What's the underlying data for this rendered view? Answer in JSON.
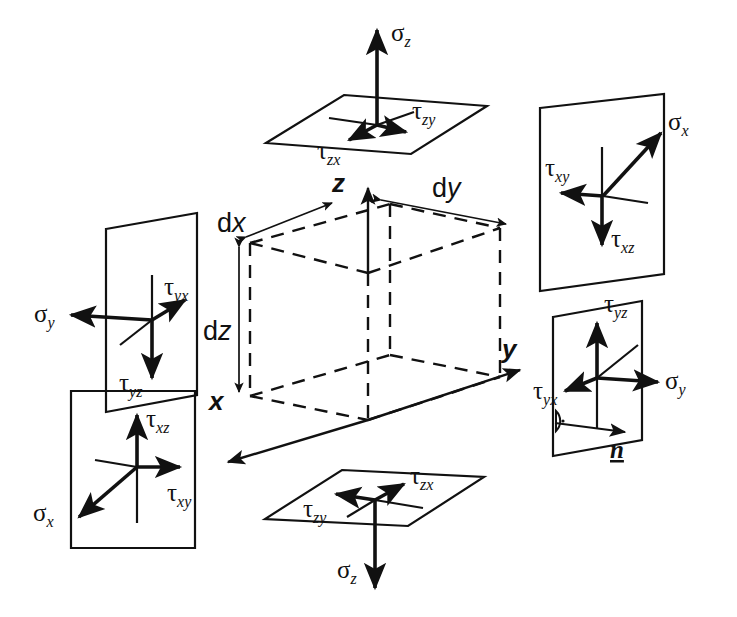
{
  "figure": {
    "background_color": "#ffffff",
    "stroke_color": "#111111",
    "greek_sigma": "σ",
    "greek_tau": "τ"
  },
  "cube": {
    "axes": [
      {
        "name": "z-axis",
        "label": "z",
        "direction": "up"
      },
      {
        "name": "y-axis",
        "label": "y",
        "direction": "right"
      },
      {
        "name": "x-axis",
        "label": "x",
        "direction": "down-left"
      }
    ],
    "dimensions": [
      {
        "name": "dx",
        "prefix": "d",
        "variable": "x",
        "label": "dx",
        "edge": "x-direction"
      },
      {
        "name": "dy",
        "prefix": "d",
        "variable": "y",
        "label": "dy",
        "edge": "y-direction"
      },
      {
        "name": "dz",
        "prefix": "d",
        "variable": "z",
        "label": "dz",
        "edge": "z-direction"
      }
    ],
    "edge_style": "dashed"
  },
  "panels": [
    {
      "id": "top-face",
      "name": "positive-z-face",
      "shape": "parallelogram",
      "vectors": [
        {
          "symbol": "σ",
          "subscript": "z",
          "label": "σz",
          "kind": "normal",
          "direction": "up"
        },
        {
          "symbol": "τ",
          "subscript": "zy",
          "label": "τzy",
          "kind": "shear",
          "direction": "right"
        },
        {
          "symbol": "τ",
          "subscript": "zx",
          "label": "τzx",
          "kind": "shear",
          "direction": "down-left"
        }
      ]
    },
    {
      "id": "top-right-face",
      "name": "positive-x-face",
      "shape": "parallelogram",
      "vectors": [
        {
          "symbol": "σ",
          "subscript": "x",
          "label": "σx",
          "kind": "normal",
          "direction": "up-right"
        },
        {
          "symbol": "τ",
          "subscript": "xy",
          "label": "τxy",
          "kind": "shear",
          "direction": "left"
        },
        {
          "symbol": "τ",
          "subscript": "xz",
          "label": "τxz",
          "kind": "shear",
          "direction": "down"
        }
      ]
    },
    {
      "id": "left-face",
      "name": "negative-y-face",
      "shape": "parallelogram",
      "vectors": [
        {
          "symbol": "σ",
          "subscript": "y",
          "label": "σy",
          "kind": "normal",
          "direction": "left"
        },
        {
          "symbol": "τ",
          "subscript": "yx",
          "label": "τyx",
          "kind": "shear",
          "direction": "up-right"
        },
        {
          "symbol": "τ",
          "subscript": "yz",
          "label": "τyz",
          "kind": "shear",
          "direction": "down"
        }
      ]
    },
    {
      "id": "bottom-left-face",
      "name": "negative-x-face",
      "shape": "parallelogram",
      "vectors": [
        {
          "symbol": "σ",
          "subscript": "x",
          "label": "σx",
          "kind": "normal",
          "direction": "down-left"
        },
        {
          "symbol": "τ",
          "subscript": "xz",
          "label": "τxz",
          "kind": "shear",
          "direction": "up"
        },
        {
          "symbol": "τ",
          "subscript": "xy",
          "label": "τxy",
          "kind": "shear",
          "direction": "right"
        }
      ]
    },
    {
      "id": "bottom-face",
      "name": "negative-z-face",
      "shape": "parallelogram",
      "vectors": [
        {
          "symbol": "σ",
          "subscript": "z",
          "label": "σz",
          "kind": "normal",
          "direction": "down"
        },
        {
          "symbol": "τ",
          "subscript": "zy",
          "label": "τzy",
          "kind": "shear",
          "direction": "left"
        },
        {
          "symbol": "τ",
          "subscript": "zx",
          "label": "τzx",
          "kind": "shear",
          "direction": "up-right"
        }
      ]
    },
    {
      "id": "right-face",
      "name": "positive-y-face",
      "shape": "parallelogram",
      "vectors": [
        {
          "symbol": "σ",
          "subscript": "y",
          "label": "σy",
          "kind": "normal",
          "direction": "right"
        },
        {
          "symbol": "τ",
          "subscript": "yz",
          "label": "τyz",
          "kind": "shear",
          "direction": "up"
        },
        {
          "symbol": "τ",
          "subscript": "yx",
          "label": "τyx",
          "kind": "shear",
          "direction": "down-left"
        }
      ],
      "normal_vector": {
        "label": "n",
        "style": "italic-underlined",
        "direction": "right",
        "marker": "perpendicular"
      }
    }
  ]
}
